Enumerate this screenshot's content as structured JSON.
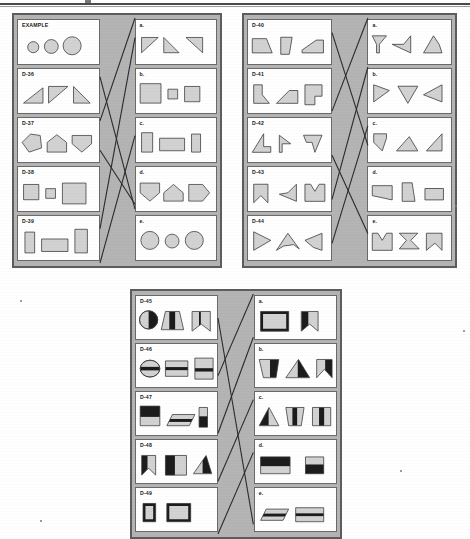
{
  "page": {
    "kind": "printed-test-page",
    "width": 470,
    "height": 539,
    "top_rule": true,
    "colors": {
      "paper": "#ffffff",
      "panel_fill": "#b4b4b4",
      "panel_border": "#5d5d5d",
      "cell_fill": "#ffffff",
      "cell_border": "#6a6a6a",
      "shape_fill": "#d2d2d2",
      "shape_fill_dark": "#1c1c1c",
      "shape_stroke": "#3a3a3a",
      "answer_line": "#2b2b2b",
      "label_text": "#1a1a1a"
    }
  },
  "panels": [
    {
      "id": "panel-1",
      "x": 12,
      "y": 13,
      "w": 210,
      "h": 255,
      "problems": [
        {
          "label": "EXAMPLE",
          "name": "problem-example",
          "shapes": [
            {
              "kind": "circle",
              "cx": 22,
              "cy": 22,
              "r": 8
            },
            {
              "kind": "circle",
              "cx": 48,
              "cy": 21,
              "r": 10
            },
            {
              "kind": "circle",
              "cx": 78,
              "cy": 20,
              "r": 13
            }
          ]
        },
        {
          "label": "D-36",
          "name": "problem-d36",
          "shapes": [
            {
              "kind": "poly",
              "points": "8,32 36,32 36,10"
            },
            {
              "kind": "poly",
              "points": "44,8 72,8 44,32"
            },
            {
              "kind": "poly",
              "points": "80,8 80,32 104,32"
            }
          ]
        },
        {
          "label": "D-37",
          "name": "problem-d37",
          "shapes": [
            {
              "kind": "poly",
              "points": "6,18 18,6 32,8 34,26 16,32"
            },
            {
              "kind": "poly",
              "points": "42,32 42,18 56,7 70,18 70,32"
            },
            {
              "kind": "poly",
              "points": "78,8 106,8 106,20 92,32 78,20"
            }
          ]
        },
        {
          "label": "D-38",
          "name": "problem-d38",
          "shapes": [
            {
              "kind": "rect",
              "x": 8,
              "y": 8,
              "w": 22,
              "h": 22
            },
            {
              "kind": "rect",
              "x": 40,
              "y": 14,
              "w": 14,
              "h": 14
            },
            {
              "kind": "rect",
              "x": 64,
              "y": 6,
              "w": 34,
              "h": 30
            }
          ]
        },
        {
          "label": "D-39",
          "name": "problem-d39",
          "shapes": [
            {
              "kind": "rect",
              "x": 10,
              "y": 6,
              "w": 14,
              "h": 30
            },
            {
              "kind": "rect",
              "x": 34,
              "y": 16,
              "w": 38,
              "h": 18
            },
            {
              "kind": "rect",
              "x": 82,
              "y": 2,
              "w": 18,
              "h": 34
            }
          ]
        }
      ],
      "options": [
        {
          "label": "a.",
          "name": "option-a",
          "shapes": [
            {
              "kind": "poly",
              "points": "8,8 32,8 8,30"
            },
            {
              "kind": "poly",
              "points": "40,8 62,30 40,30"
            },
            {
              "kind": "poly",
              "points": "72,8 96,8 96,30"
            }
          ]
        },
        {
          "label": "b.",
          "name": "option-b",
          "shapes": [
            {
              "kind": "rect",
              "x": 6,
              "y": 4,
              "w": 30,
              "h": 28
            },
            {
              "kind": "rect",
              "x": 46,
              "y": 12,
              "w": 14,
              "h": 14
            },
            {
              "kind": "rect",
              "x": 70,
              "y": 8,
              "w": 22,
              "h": 22
            }
          ]
        },
        {
          "label": "c.",
          "name": "option-c",
          "shapes": [
            {
              "kind": "rect",
              "x": 8,
              "y": 4,
              "w": 16,
              "h": 28
            },
            {
              "kind": "rect",
              "x": 34,
              "y": 12,
              "w": 36,
              "h": 18
            },
            {
              "kind": "rect",
              "x": 80,
              "y": 6,
              "w": 13,
              "h": 26
            }
          ]
        },
        {
          "label": "d.",
          "name": "option-d",
          "shapes": [
            {
              "kind": "poly",
              "points": "6,6 34,6 34,20 20,32 6,20"
            },
            {
              "kind": "poly",
              "points": "40,32 40,20 54,8 68,20 68,32"
            },
            {
              "kind": "poly",
              "points": "76,8 96,8 106,20 96,32 76,32"
            }
          ]
        },
        {
          "label": "e.",
          "name": "option-e",
          "shapes": [
            {
              "kind": "circle",
              "cx": 20,
              "cy": 18,
              "r": 13
            },
            {
              "kind": "circle",
              "cx": 52,
              "cy": 19,
              "r": 10
            },
            {
              "kind": "circle",
              "cx": 84,
              "cy": 18,
              "r": 13
            }
          ]
        }
      ],
      "answer_lines": [
        {
          "x1": 0,
          "y1": 42,
          "x2": 100,
          "y2": 0
        },
        {
          "x1": 0,
          "y1": 86,
          "x2": 100,
          "y2": 8
        },
        {
          "x1": 0,
          "y1": 24,
          "x2": 100,
          "y2": 78
        },
        {
          "x1": 0,
          "y1": 54,
          "x2": 100,
          "y2": 76
        },
        {
          "x1": 0,
          "y1": 100,
          "x2": 100,
          "y2": 48
        }
      ]
    },
    {
      "id": "panel-2",
      "x": 242,
      "y": 13,
      "w": 215,
      "h": 255,
      "problems": [
        {
          "label": "D-40",
          "name": "problem-d40",
          "shapes": [
            {
              "kind": "poly",
              "points": "6,10 26,10 34,30 6,30"
            },
            {
              "kind": "poly",
              "points": "46,8 62,8 58,32 46,32"
            },
            {
              "kind": "poly",
              "points": "76,26 96,12 106,12 106,30 76,30"
            }
          ]
        },
        {
          "label": "D-41",
          "name": "problem-d41",
          "shapes": [
            {
              "kind": "poly",
              "points": "8,6 20,6 20,20 30,32 8,32"
            },
            {
              "kind": "poly",
              "points": "40,32 58,14 70,14 70,32"
            },
            {
              "kind": "poly",
              "points": "80,6 104,6 104,22 94,22 94,34 80,34"
            }
          ]
        },
        {
          "label": "D-42",
          "name": "problem-d42",
          "shapes": [
            {
              "kind": "poly",
              "points": "22,6 22,24 32,24 32,32 6,32"
            },
            {
              "kind": "poly",
              "points": "44,8 60,20 48,20 48,32 44,32"
            },
            {
              "kind": "poly",
              "points": "78,8 104,8 94,32 90,18 82,18"
            }
          ]
        },
        {
          "label": "D-43",
          "name": "problem-d43",
          "shapes": [
            {
              "kind": "poly",
              "points": "8,8 28,8 28,34 18,24 8,34"
            },
            {
              "kind": "poly",
              "points": "68,8 68,32 44,22 56,20"
            },
            {
              "kind": "poly",
              "points": "80,8 88,8 94,18 100,8 108,8 108,32 80,32"
            }
          ]
        },
        {
          "label": "D-44",
          "name": "problem-d44",
          "shapes": [
            {
              "kind": "poly",
              "points": "8,6 32,18 8,32"
            },
            {
              "kind": "poly",
              "points": "40,32 56,8 72,30 64,24 50,26"
            },
            {
              "kind": "poly",
              "points": "80,18 104,8 104,32 92,28"
            }
          ]
        }
      ],
      "options": [
        {
          "label": "a.",
          "name": "option-a",
          "shapes": [
            {
              "kind": "poly",
              "points": "6,6 26,6 16,18 16,30 12,30 12,18"
            },
            {
              "kind": "poly",
              "points": "60,6 60,30 34,18 50,18"
            },
            {
              "kind": "poly",
              "points": "78,30 92,6 100,18 104,30"
            }
          ]
        },
        {
          "label": "b.",
          "name": "option-b",
          "shapes": [
            {
              "kind": "poly",
              "points": "8,6 30,14 8,30"
            },
            {
              "kind": "poly",
              "points": "42,8 70,8 56,32"
            },
            {
              "kind": "poly",
              "points": "104,6 104,30 78,20"
            }
          ]
        },
        {
          "label": "c.",
          "name": "option-c",
          "shapes": [
            {
              "kind": "poly",
              "points": "8,6 26,6 26,12 20,30 8,18"
            },
            {
              "kind": "poly",
              "points": "40,30 58,10 70,30"
            },
            {
              "kind": "poly",
              "points": "82,30 104,6 104,30"
            }
          ]
        },
        {
          "label": "d.",
          "name": "option-d",
          "shapes": [
            {
              "kind": "poly",
              "points": "6,10 34,10 34,30 6,24"
            },
            {
              "kind": "poly",
              "points": "48,6 62,6 66,32 48,32"
            },
            {
              "kind": "poly",
              "points": "80,14 106,14 106,30 80,30"
            }
          ]
        },
        {
          "label": "e.",
          "name": "option-e",
          "shapes": [
            {
              "kind": "poly",
              "points": "6,8 14,8 20,18 26,8 34,8 34,32 6,32"
            },
            {
              "kind": "poly",
              "points": "44,8 70,8 60,18 72,30 44,30 54,18"
            },
            {
              "kind": "poly",
              "points": "82,8 104,8 104,32 94,22 82,32"
            }
          ]
        }
      ],
      "answer_lines": [
        {
          "x1": 0,
          "y1": 6,
          "x2": 100,
          "y2": 52
        },
        {
          "x1": 0,
          "y1": 38,
          "x2": 100,
          "y2": 0
        },
        {
          "x1": 0,
          "y1": 56,
          "x2": 100,
          "y2": 88
        },
        {
          "x1": 0,
          "y1": 74,
          "x2": 100,
          "y2": 20
        },
        {
          "x1": 0,
          "y1": 92,
          "x2": 100,
          "y2": 44
        }
      ]
    },
    {
      "id": "panel-3",
      "x": 130,
      "y": 289,
      "w": 212,
      "h": 250,
      "problems": [
        {
          "label": "D-45",
          "name": "problem-d45",
          "shapes": [
            {
              "kind": "circle-half",
              "cx": 18,
              "cy": 18,
              "r": 13
            },
            {
              "kind": "poly",
              "points": "42,6 62,6 68,32 36,32",
              "bands": "v-dark-center"
            },
            {
              "kind": "poly",
              "points": "80,6 106,6 106,34 93,24 80,34",
              "bands": "v-split"
            }
          ]
        },
        {
          "label": "D-46",
          "name": "problem-d46",
          "shapes": [
            {
              "kind": "ellipse-band",
              "cx": 20,
              "cy": 19,
              "rx": 14,
              "ry": 12
            },
            {
              "kind": "rect-band",
              "x": 42,
              "y": 8,
              "w": 32,
              "h": 22,
              "band": "mid"
            },
            {
              "kind": "rect-band",
              "x": 84,
              "y": 4,
              "w": 26,
              "h": 30,
              "band": "mid-low"
            }
          ]
        },
        {
          "label": "D-47",
          "name": "problem-d47",
          "shapes": [
            {
              "kind": "rect-band",
              "x": 6,
              "y": 4,
              "w": 28,
              "h": 28,
              "band": "top-dark"
            },
            {
              "kind": "para-band",
              "x": 44,
              "y": 16,
              "w": 32,
              "h": 16
            },
            {
              "kind": "rect-band",
              "x": 90,
              "y": 6,
              "w": 12,
              "h": 28,
              "band": "bottom-dark"
            }
          ]
        },
        {
          "label": "D-48",
          "name": "problem-d48",
          "shapes": [
            {
              "kind": "poly",
              "points": "8,6 28,6 28,34 18,24 8,34",
              "bands": "left-dark"
            },
            {
              "kind": "rect-band",
              "x": 42,
              "y": 6,
              "w": 30,
              "h": 28,
              "band": "left-dark"
            },
            {
              "kind": "poly",
              "points": "82,32 100,6 108,32",
              "bands": "tri-dark"
            }
          ]
        },
        {
          "label": "D-49",
          "name": "problem-d49",
          "shapes": [
            {
              "kind": "rect-band",
              "x": 10,
              "y": 6,
              "w": 18,
              "h": 26,
              "band": "frame-dark"
            },
            {
              "kind": "rect-band",
              "x": 44,
              "y": 6,
              "w": 34,
              "h": 26,
              "band": "frame-dark"
            }
          ]
        }
      ],
      "options": [
        {
          "label": "a.",
          "name": "option-a",
          "shapes": [
            {
              "kind": "rect-band",
              "x": 8,
              "y": 6,
              "w": 40,
              "h": 28,
              "band": "frame-dark"
            },
            {
              "kind": "poly",
              "points": "66,6 90,6 90,34 78,24 66,34",
              "bands": "left-dark"
            }
          ]
        },
        {
          "label": "b.",
          "name": "option-b",
          "shapes": [
            {
              "kind": "poly",
              "points": "6,6 34,6 30,32 12,32",
              "bands": "right-dark"
            },
            {
              "kind": "poly",
              "points": "44,32 62,6 78,32",
              "bands": "tri-dark"
            },
            {
              "kind": "poly",
              "points": "88,6 110,6 110,32 99,20 88,32",
              "bands": "right-dark"
            }
          ]
        },
        {
          "label": "c.",
          "name": "option-c",
          "shapes": [
            {
              "kind": "poly",
              "points": "6,32 20,6 34,32",
              "bands": "tri-left-dark"
            },
            {
              "kind": "poly",
              "points": "44,6 70,6 66,32 48,32",
              "bands": "v-dark-center"
            },
            {
              "kind": "rect-band",
              "x": 82,
              "y": 6,
              "w": 26,
              "h": 26,
              "band": "v-dark-center"
            }
          ]
        },
        {
          "label": "d.",
          "name": "option-d",
          "shapes": [
            {
              "kind": "rect-band",
              "x": 8,
              "y": 8,
              "w": 42,
              "h": 24,
              "band": "top-dark"
            },
            {
              "kind": "rect-band",
              "x": 72,
              "y": 8,
              "w": 26,
              "h": 24,
              "band": "bottom-dark"
            }
          ]
        },
        {
          "label": "e.",
          "name": "option-e",
          "shapes": [
            {
              "kind": "para-band",
              "x": 8,
              "y": 14,
              "w": 32,
              "h": 16
            },
            {
              "kind": "rect-band",
              "x": 58,
              "y": 12,
              "w": 40,
              "h": 20,
              "band": "mid"
            }
          ]
        }
      ],
      "answer_lines": [
        {
          "x1": 0,
          "y1": 10,
          "x2": 100,
          "y2": 96
        },
        {
          "x1": 0,
          "y1": 34,
          "x2": 100,
          "y2": 0
        },
        {
          "x1": 0,
          "y1": 58,
          "x2": 100,
          "y2": 18
        },
        {
          "x1": 0,
          "y1": 78,
          "x2": 100,
          "y2": 44
        },
        {
          "x1": 0,
          "y1": 100,
          "x2": 100,
          "y2": 66
        }
      ]
    }
  ]
}
